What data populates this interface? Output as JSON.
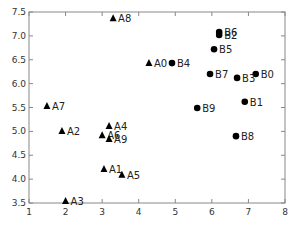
{
  "chart_data": {
    "type": "scatter",
    "title": "",
    "xlabel": "",
    "ylabel": "",
    "xlim": [
      1,
      8
    ],
    "ylim": [
      3.5,
      7.5
    ],
    "xticks": [
      "1",
      "2",
      "3",
      "4",
      "5",
      "6",
      "7",
      "8"
    ],
    "yticks": [
      "3.5",
      "4.0",
      "4.5",
      "5.0",
      "5.5",
      "6.0",
      "6.5",
      "7.0",
      "7.5"
    ],
    "grid": false,
    "legend": null,
    "series": [
      {
        "name": "A",
        "marker": "triangle",
        "color": "#000000",
        "points": [
          {
            "label": "A0",
            "x": 4.28,
            "y": 6.43
          },
          {
            "label": "A1",
            "x": 3.05,
            "y": 4.21
          },
          {
            "label": "A2",
            "x": 1.9,
            "y": 5.01
          },
          {
            "label": "A3",
            "x": 2.0,
            "y": 3.54
          },
          {
            "label": "A4",
            "x": 3.19,
            "y": 5.11
          },
          {
            "label": "A5",
            "x": 3.54,
            "y": 4.09
          },
          {
            "label": "A6",
            "x": 3.0,
            "y": 4.92
          },
          {
            "label": "A7",
            "x": 1.49,
            "y": 5.53
          },
          {
            "label": "A8",
            "x": 3.3,
            "y": 7.37
          },
          {
            "label": "A9",
            "x": 3.19,
            "y": 4.84
          }
        ]
      },
      {
        "name": "B",
        "marker": "circle",
        "color": "#000000",
        "points": [
          {
            "label": "B0",
            "x": 7.2,
            "y": 6.2
          },
          {
            "label": "B1",
            "x": 6.9,
            "y": 5.62
          },
          {
            "label": "B2",
            "x": 6.2,
            "y": 7.02
          },
          {
            "label": "B3",
            "x": 6.69,
            "y": 6.12
          },
          {
            "label": "B4",
            "x": 4.91,
            "y": 6.43
          },
          {
            "label": "B5",
            "x": 6.06,
            "y": 6.72
          },
          {
            "label": "B6",
            "x": 6.2,
            "y": 7.08
          },
          {
            "label": "B7",
            "x": 5.95,
            "y": 6.2
          },
          {
            "label": "B8",
            "x": 6.66,
            "y": 4.9
          },
          {
            "label": "B9",
            "x": 5.6,
            "y": 5.49
          }
        ]
      }
    ]
  }
}
